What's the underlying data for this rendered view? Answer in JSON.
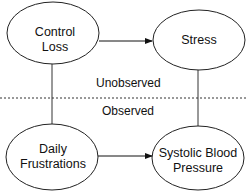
{
  "diagram": {
    "nodes": [
      {
        "id": "control-loss",
        "line1": "Control",
        "line2": "Loss",
        "layer": "Unobserved"
      },
      {
        "id": "stress",
        "line1": "Stress",
        "line2": "",
        "layer": "Unobserved"
      },
      {
        "id": "daily-frustrations",
        "line1": "Daily",
        "line2": "Frustrations",
        "layer": "Observed"
      },
      {
        "id": "systolic-blood-pressure",
        "line1": "Systolic Blood",
        "line2": "Pressure",
        "layer": "Observed"
      }
    ],
    "edges": [
      {
        "from": "control-loss",
        "to": "stress",
        "type": "arrow"
      },
      {
        "from": "daily-frustrations",
        "to": "systolic-blood-pressure",
        "type": "arrow"
      },
      {
        "from": "control-loss",
        "to": "daily-frustrations",
        "type": "line"
      },
      {
        "from": "stress",
        "to": "systolic-blood-pressure",
        "type": "line"
      }
    ],
    "layers": {
      "top_label": "Unobserved",
      "bottom_label": "Observed"
    }
  }
}
